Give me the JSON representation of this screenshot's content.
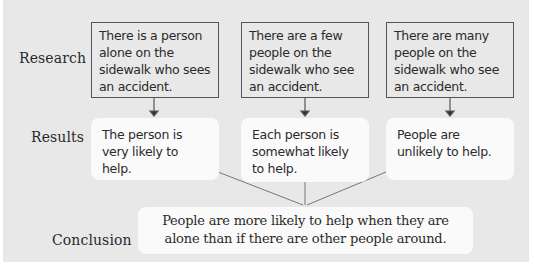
{
  "diagram": {
    "rows": {
      "research": "Research",
      "results": "Results",
      "conclusion": "Conclusion"
    },
    "columns": [
      {
        "research": "There is a person alone on the sidewalk who sees an accident.",
        "result": "The person is very likely to help."
      },
      {
        "research": "There are a few people on the sidewalk who see an accident.",
        "result": "Each person is somewhat likely to help."
      },
      {
        "research": "There are many people on the sidewalk who see an accident.",
        "result": "People are unlikely to help."
      }
    ],
    "conclusion_text": "People are more likely to help when they are alone than if there are other people around.",
    "colors": {
      "panel": "#e8e8e8",
      "box_border": "#555555",
      "result_fill": "#fafafa",
      "line": "#666666",
      "text": "#2b2b2b"
    }
  }
}
